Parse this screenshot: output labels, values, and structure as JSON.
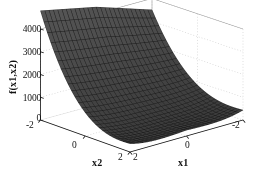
{
  "figure": {
    "background_color": "#ffffff",
    "axis_color": "#111111",
    "grid_color": "#b9b9b9",
    "surface_face_color": "#5a5a5a",
    "surface_edge_color": "#151515",
    "width": 256,
    "height": 181
  },
  "chart_data": {
    "type": "surface",
    "title": "",
    "xlabel": "x1",
    "ylabel": "x2",
    "zlabel": "f(x1,x2)",
    "grid": true,
    "legend": null,
    "projection": "3d",
    "xlim": [
      -2,
      2
    ],
    "ylim": [
      -2,
      2
    ],
    "zlim": [
      0,
      4000
    ],
    "xticks": [
      2,
      0,
      -2
    ],
    "xticklabels": [
      "2",
      "0",
      "-2"
    ],
    "yticks": [
      -2,
      0,
      2
    ],
    "yticklabels": [
      "-2",
      "0",
      "2"
    ],
    "zticks": [
      0,
      1000,
      2000,
      3000,
      4000
    ],
    "zticklabels": [
      "0",
      "1000",
      "2000",
      "3000",
      "4000"
    ],
    "surface_samples": 26,
    "corner_values": {
      "x1_neg2_x2_neg2": 3500,
      "x1_pos2_x2_neg2": 4800,
      "x1_neg2_x2_pos2": 150,
      "x1_pos2_x2_pos2": 80
    }
  },
  "view": {
    "azimuth_deg": -37.5,
    "elevation_deg": 30
  }
}
